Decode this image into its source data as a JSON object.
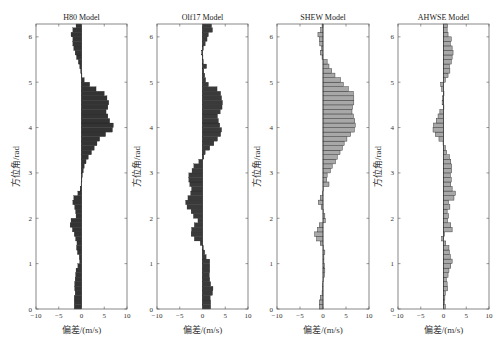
{
  "chart_data": [
    {
      "type": "bar",
      "orientation": "horizontal",
      "title": "H80 Model",
      "xlabel": "偏差/(m/s)",
      "ylabel": "方位角/rad",
      "xlim": [
        -10,
        10
      ],
      "ylim": [
        0,
        6.283
      ],
      "xticks": [
        "-10",
        "-5",
        "0",
        "5",
        "10"
      ],
      "yticks": [
        "0",
        "1",
        "2",
        "3",
        "4",
        "5",
        "6"
      ],
      "bar_color": "#333333",
      "bin_width": 0.1,
      "values": [
        -1.6,
        -1.6,
        -1.6,
        -1.4,
        -1.5,
        -1.5,
        -1.4,
        -1.3,
        -1.2,
        -0.8,
        -0.4,
        -0.5,
        -0.9,
        -1.1,
        -1.0,
        -1.3,
        -1.6,
        -2.0,
        -2.5,
        -2.3,
        -1.2,
        -1.3,
        -1.5,
        -1.9,
        -1.7,
        -0.8,
        -0.3,
        -0.1,
        0.1,
        0.2,
        0.4,
        0.6,
        1.0,
        1.5,
        2.2,
        2.8,
        3.4,
        4.0,
        5.3,
        6.8,
        7.0,
        6.2,
        5.8,
        5.4,
        5.8,
        6.0,
        5.6,
        5.0,
        3.2,
        1.8,
        0.6,
        0.1,
        -0.2,
        -0.4,
        -0.7,
        -1.1,
        -1.4,
        -1.7,
        -1.9,
        -1.9,
        -2.3,
        -1.9,
        -1.2
      ]
    },
    {
      "type": "bar",
      "orientation": "horizontal",
      "title": "Olf17 Model",
      "xlabel": "偏差/(m/s)",
      "ylabel": "方位角/rad",
      "xlim": [
        -10,
        10
      ],
      "ylim": [
        0,
        6.283
      ],
      "xticks": [
        "-10",
        "-5",
        "0",
        "5",
        "10"
      ],
      "yticks": [
        "0",
        "1",
        "2",
        "3",
        "4",
        "5",
        "6"
      ],
      "bar_color": "#3a3a3a",
      "bin_width": 0.1,
      "values": [
        1.8,
        1.8,
        1.7,
        2.2,
        2.3,
        1.8,
        1.6,
        1.5,
        1.6,
        1.6,
        1.6,
        0.8,
        0.5,
        0.2,
        -0.5,
        -1.8,
        -2.5,
        -2.4,
        -1.8,
        -1.0,
        -2.0,
        -2.5,
        -3.4,
        -3.7,
        -3.2,
        -2.6,
        -2.4,
        -2.8,
        -3.0,
        -3.0,
        -2.3,
        -1.9,
        -0.8,
        0.3,
        0.6,
        1.6,
        2.5,
        3.3,
        4.0,
        4.2,
        3.8,
        3.5,
        3.3,
        3.9,
        4.3,
        4.4,
        4.2,
        4.0,
        3.2,
        1.3,
        0.7,
        0.5,
        0.3,
        0.9,
        0.2,
        0.1,
        -0.2,
        0.2,
        0.6,
        1.0,
        1.3,
        2.2,
        2.0
      ]
    },
    {
      "type": "bar",
      "orientation": "horizontal",
      "title": "SHEW Model",
      "xlabel": "偏差/(m/s)",
      "ylabel": "方位角/rad",
      "xlim": [
        -10,
        10
      ],
      "ylim": [
        0,
        6.283
      ],
      "xticks": [
        "-10",
        "-5",
        "0",
        "5",
        "10"
      ],
      "yticks": [
        "0",
        "1",
        "2",
        "3",
        "4",
        "5",
        "6"
      ],
      "bar_color": "#a8a8a8",
      "bin_width": 0.1,
      "values": [
        -0.8,
        -0.8,
        -0.6,
        -0.2,
        -0.1,
        -0.1,
        0.1,
        0.3,
        0.4,
        0.3,
        0.2,
        0.2,
        0.4,
        0.1,
        -0.6,
        -1.4,
        -1.8,
        -1.2,
        -0.8,
        0.5,
        0.4,
        0.0,
        -0.4,
        -1.0,
        -0.6,
        -0.1,
        0.1,
        1.3,
        0.8,
        0.9,
        1.6,
        2.0,
        2.7,
        3.1,
        3.7,
        4.2,
        4.6,
        5.2,
        6.0,
        6.8,
        7.0,
        6.9,
        6.6,
        6.3,
        6.4,
        6.7,
        6.7,
        6.6,
        5.5,
        4.4,
        3.8,
        2.6,
        1.9,
        1.3,
        0.9,
        -0.2,
        -0.6,
        -0.3,
        -0.7,
        -0.8,
        -1.1,
        -0.5,
        -0.2
      ]
    },
    {
      "type": "bar",
      "orientation": "horizontal",
      "title": "AHWSE Model",
      "xlabel": "偏差/(m/s)",
      "ylabel": "方位角/rad",
      "xlim": [
        -10,
        10
      ],
      "ylim": [
        0,
        6.283
      ],
      "xticks": [
        "-10",
        "-5",
        "0",
        "5",
        "10"
      ],
      "yticks": [
        "0",
        "1",
        "2",
        "3",
        "4",
        "5",
        "6"
      ],
      "bar_color": "#a8a8a8",
      "bin_width": 0.1,
      "values": [
        0.4,
        0.2,
        0.3,
        0.4,
        0.9,
        0.8,
        0.6,
        1.0,
        1.2,
        1.6,
        1.9,
        1.5,
        1.3,
        1.2,
        0.5,
        -0.4,
        0.2,
        1.9,
        1.6,
        0.9,
        1.1,
        0.8,
        1.4,
        1.1,
        2.3,
        2.6,
        1.9,
        1.6,
        1.7,
        1.5,
        1.8,
        1.8,
        1.6,
        1.3,
        0.7,
        0.4,
        -0.1,
        -1.0,
        -1.8,
        -2.3,
        -2.2,
        -1.6,
        -1.2,
        -0.8,
        0.0,
        -0.3,
        -0.2,
        0.1,
        -0.4,
        -0.6,
        0.4,
        1.0,
        1.4,
        1.3,
        1.7,
        1.9,
        2.1,
        1.9,
        1.5,
        1.7,
        1.0,
        0.8,
        0.9
      ]
    }
  ]
}
